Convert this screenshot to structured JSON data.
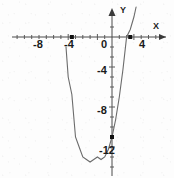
{
  "figure": {
    "title": "",
    "background_color": "#fdfdfd",
    "curve_color": "#6b6b6b",
    "axis_color": "#4a4a4a",
    "label_color": "#1a1a1a",
    "point_color": "#111111"
  },
  "axes": {
    "x_axis_label": "X",
    "y_axis_label": "Y",
    "x_tick_labels": [
      "-8",
      "-4",
      "0",
      "4"
    ],
    "x_tick_values": [
      -8,
      -4,
      0,
      4
    ],
    "y_tick_labels": [
      "-4",
      "-8",
      "-12"
    ],
    "y_tick_values": [
      -4,
      -8,
      -12
    ],
    "minor_tick_step": 1,
    "x_arrow": "arrow-right",
    "y_arrow": "arrow-up",
    "grid": false
  },
  "chart_data": {
    "type": "line",
    "title": "",
    "xlabel": "X",
    "ylabel": "Y",
    "xlim": [
      -11,
      8.5
    ],
    "ylim": [
      -15.5,
      3
    ],
    "grid": false,
    "legend": "none",
    "curve": {
      "name": "parabola",
      "equation": "y = x^2 + 3x - 10",
      "vertex": [
        -1.5,
        -12.25
      ],
      "x_intercepts": [
        -5.5,
        2.5
      ],
      "y_intercept": -10,
      "opens": "up",
      "x": [
        -6.3,
        -6.0,
        -5.5,
        -5.0,
        -4.5,
        -4.0,
        -3.5,
        -3.0,
        -2.5,
        -2.0,
        -1.5,
        -1.0,
        -0.5,
        0.0,
        0.5,
        1.0,
        1.5,
        2.0,
        2.5,
        3.0,
        3.3
      ],
      "y": [
        -1.0,
        -4.0,
        -5.75,
        -10.0,
        -11.0,
        -12.0,
        -12.25,
        -12.5,
        -12.25,
        -12.0,
        -12.25,
        -12.0,
        -11.25,
        -10.0,
        -8.25,
        -6.0,
        -3.25,
        0.0,
        0.75,
        2.0,
        3.0
      ]
    },
    "marked_points": [
      {
        "name": "left-x-intercept",
        "x": -5.5,
        "y": 0,
        "style": "filled-square"
      },
      {
        "name": "right-x-intercept",
        "x": 2.5,
        "y": 0,
        "style": "filled-square"
      },
      {
        "name": "y-intercept",
        "x": 0,
        "y": -10,
        "style": "filled-square"
      }
    ]
  },
  "tick_label_positions": {
    "x": [
      {
        "label": "-8",
        "px": 38,
        "py": 48
      },
      {
        "label": "-4",
        "px": 69,
        "py": 48
      },
      {
        "label": "0",
        "px": 104,
        "py": 48
      },
      {
        "label": "4",
        "px": 142,
        "py": 48
      }
    ],
    "y": [
      {
        "label": "-4",
        "px": 102,
        "py": 74
      },
      {
        "label": "-8",
        "px": 102,
        "py": 114
      },
      {
        "label": "-12",
        "px": 107,
        "py": 154
      }
    ]
  }
}
